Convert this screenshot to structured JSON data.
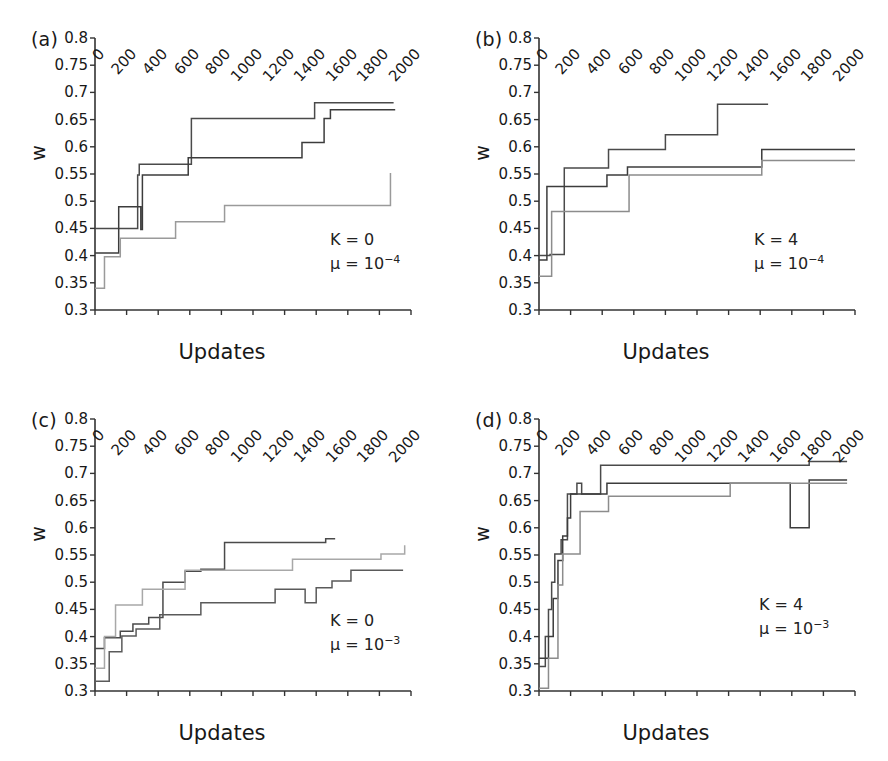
{
  "figure": {
    "panel_count": 4,
    "axis": {
      "ylabel": "w",
      "xlabel": "Updates",
      "yticks": [
        "0.3",
        "0.35",
        "0.4",
        "0.45",
        "0.5",
        "0.55",
        "0.6",
        "0.65",
        "0.7",
        "0.75",
        "0.8"
      ],
      "ytick_values": [
        0.3,
        0.35,
        0.4,
        0.45,
        0.5,
        0.55,
        0.6,
        0.65,
        0.7,
        0.75,
        0.8
      ],
      "xticks": [
        "0",
        "200",
        "400",
        "600",
        "800",
        "1000",
        "1200",
        "1400",
        "1600",
        "1800",
        "2000"
      ],
      "xtick_values": [
        0,
        200,
        400,
        600,
        800,
        1000,
        1200,
        1400,
        1600,
        1800,
        2000
      ],
      "ylim": [
        0.3,
        0.8
      ],
      "xlim": [
        0,
        2000
      ]
    },
    "colors": {
      "line_dark": "#3a3a3a",
      "line_mid": "#5a5a5a",
      "line_light": "#8e8e8e",
      "axis": "#333333",
      "text": "#181818"
    },
    "panels": [
      {
        "id": "a",
        "label": "(a)",
        "annotation_k": "K = 0",
        "annotation_mu_base": "μ = 10",
        "annotation_mu_exp": "−4"
      },
      {
        "id": "b",
        "label": "(b)",
        "annotation_k": "K = 4",
        "annotation_mu_base": "μ = 10",
        "annotation_mu_exp": "−4"
      },
      {
        "id": "c",
        "label": "(c)",
        "annotation_k": "K = 0",
        "annotation_mu_base": "μ = 10",
        "annotation_mu_exp": "−3"
      },
      {
        "id": "d",
        "label": "(d)",
        "annotation_k": "K = 4",
        "annotation_mu_base": "μ = 10",
        "annotation_mu_exp": "−3"
      }
    ]
  },
  "chart_data": [
    {
      "type": "line",
      "panel": "a",
      "title": "(a) K = 0, mu = 10^-4",
      "xlabel": "Updates",
      "ylabel": "w",
      "xlim": [
        0,
        2000
      ],
      "ylim": [
        0.3,
        0.8
      ],
      "grid": false,
      "legend": "none",
      "step": "post",
      "annotations": [
        "K = 0",
        "μ = 10−4"
      ],
      "series": [
        {
          "name": "replicate-1",
          "color": "#4a4a4a",
          "x": [
            0,
            30,
            150,
            160,
            270,
            280,
            600,
            610,
            1380,
            1390,
            1890
          ],
          "values": [
            0.45,
            0.45,
            0.45,
            0.45,
            0.548,
            0.568,
            0.568,
            0.652,
            0.652,
            0.681,
            0.681
          ]
        },
        {
          "name": "replicate-2",
          "color": "#3c3c3c",
          "x": [
            0,
            20,
            140,
            150,
            180,
            190,
            290,
            300,
            580,
            590,
            1300,
            1310,
            1440,
            1450,
            1480,
            1490,
            1900
          ],
          "values": [
            0.405,
            0.405,
            0.405,
            0.49,
            0.49,
            0.49,
            0.448,
            0.548,
            0.548,
            0.58,
            0.58,
            0.608,
            0.608,
            0.652,
            0.652,
            0.668,
            0.668
          ]
        },
        {
          "name": "replicate-3",
          "color": "#9a9a9a",
          "x": [
            0,
            10,
            60,
            150,
            160,
            500,
            510,
            810,
            820,
            1860,
            1870
          ],
          "values": [
            0.34,
            0.34,
            0.398,
            0.398,
            0.432,
            0.432,
            0.462,
            0.462,
            0.492,
            0.492,
            0.552
          ]
        }
      ]
    },
    {
      "type": "line",
      "panel": "b",
      "title": "(b) K = 4, mu = 10^-4",
      "xlabel": "Updates",
      "ylabel": "w",
      "xlim": [
        0,
        2000
      ],
      "ylim": [
        0.3,
        0.8
      ],
      "grid": false,
      "legend": "none",
      "step": "post",
      "annotations": [
        "K = 4",
        "μ = 10−4"
      ],
      "series": [
        {
          "name": "replicate-1",
          "color": "#4a4a4a",
          "x": [
            0,
            20,
            60,
            70,
            150,
            160,
            430,
            440,
            790,
            800,
            1120,
            1130,
            1450
          ],
          "values": [
            0.4,
            0.4,
            0.4,
            0.402,
            0.402,
            0.561,
            0.561,
            0.595,
            0.595,
            0.622,
            0.622,
            0.678,
            0.678
          ]
        },
        {
          "name": "replicate-2",
          "color": "#3c3c3c",
          "x": [
            0,
            20,
            40,
            50,
            420,
            430,
            550,
            560,
            1400,
            1410,
            2000
          ],
          "values": [
            0.392,
            0.392,
            0.392,
            0.527,
            0.527,
            0.548,
            0.548,
            0.563,
            0.563,
            0.595,
            0.595
          ]
        },
        {
          "name": "replicate-3",
          "color": "#8c8c8c",
          "x": [
            0,
            30,
            70,
            80,
            560,
            570,
            1400,
            1410,
            2000
          ],
          "values": [
            0.362,
            0.362,
            0.362,
            0.481,
            0.481,
            0.548,
            0.548,
            0.575,
            0.575
          ]
        }
      ]
    },
    {
      "type": "line",
      "panel": "c",
      "title": "(c) K = 0, mu = 10^-3",
      "xlabel": "Updates",
      "ylabel": "w",
      "xlim": [
        0,
        2000
      ],
      "ylim": [
        0.3,
        0.8
      ],
      "grid": false,
      "legend": "none",
      "step": "post",
      "annotations": [
        "K = 0",
        "μ = 10−3"
      ],
      "series": [
        {
          "name": "replicate-1",
          "color": "#4a4a4a",
          "x": [
            0,
            30,
            60,
            150,
            160,
            230,
            240,
            330,
            340,
            420,
            430,
            560,
            570,
            660,
            670,
            810,
            820,
            1450,
            1460,
            1520
          ],
          "values": [
            0.378,
            0.378,
            0.398,
            0.398,
            0.41,
            0.41,
            0.423,
            0.423,
            0.435,
            0.435,
            0.5,
            0.5,
            0.52,
            0.52,
            0.524,
            0.524,
            0.573,
            0.573,
            0.58,
            0.58
          ]
        },
        {
          "name": "replicate-2",
          "color": "#a8a8a8",
          "x": [
            0,
            20,
            60,
            120,
            130,
            290,
            300,
            560,
            570,
            1240,
            1250,
            1800,
            1810,
            1950,
            1960
          ],
          "values": [
            0.342,
            0.342,
            0.4,
            0.4,
            0.458,
            0.458,
            0.487,
            0.487,
            0.522,
            0.522,
            0.542,
            0.542,
            0.552,
            0.552,
            0.568
          ]
        },
        {
          "name": "replicate-3",
          "color": "#5a5a5a",
          "x": [
            0,
            80,
            90,
            160,
            170,
            250,
            260,
            400,
            410,
            660,
            670,
            1130,
            1140,
            1320,
            1330,
            1390,
            1400,
            1490,
            1500,
            1610,
            1620,
            1950
          ],
          "values": [
            0.318,
            0.318,
            0.372,
            0.372,
            0.401,
            0.401,
            0.414,
            0.414,
            0.44,
            0.44,
            0.462,
            0.462,
            0.487,
            0.487,
            0.462,
            0.462,
            0.49,
            0.49,
            0.502,
            0.502,
            0.522,
            0.522
          ]
        }
      ]
    },
    {
      "type": "line",
      "panel": "d",
      "title": "(d) K = 4, mu = 10^-3",
      "xlabel": "Updates",
      "ylabel": "w",
      "xlim": [
        0,
        2000
      ],
      "ylim": [
        0.3,
        0.8
      ],
      "grid": false,
      "legend": "none",
      "step": "post",
      "annotations": [
        "K = 4",
        "μ = 10−3"
      ],
      "series": [
        {
          "name": "replicate-1",
          "color": "#4a4a4a",
          "x": [
            0,
            20,
            40,
            60,
            80,
            100,
            120,
            140,
            160,
            180,
            230,
            240,
            260,
            270,
            380,
            390,
            1700,
            1710,
            1950
          ],
          "values": [
            0.345,
            0.345,
            0.4,
            0.45,
            0.5,
            0.552,
            0.552,
            0.578,
            0.578,
            0.662,
            0.662,
            0.682,
            0.682,
            0.662,
            0.662,
            0.715,
            0.715,
            0.722,
            0.722
          ]
        },
        {
          "name": "replicate-2",
          "color": "#3c3c3c",
          "x": [
            0,
            30,
            60,
            90,
            120,
            150,
            180,
            200,
            420,
            430,
            1580,
            1590,
            1700,
            1710,
            1950
          ],
          "values": [
            0.36,
            0.36,
            0.4,
            0.47,
            0.54,
            0.585,
            0.618,
            0.662,
            0.662,
            0.682,
            0.682,
            0.6,
            0.6,
            0.688,
            0.688
          ]
        },
        {
          "name": "replicate-3",
          "color": "#8c8c8c",
          "x": [
            0,
            40,
            60,
            90,
            120,
            150,
            170,
            260,
            270,
            430,
            440,
            1200,
            1210,
            1620,
            1630,
            1950
          ],
          "values": [
            0.305,
            0.305,
            0.36,
            0.36,
            0.495,
            0.552,
            0.552,
            0.63,
            0.63,
            0.63,
            0.658,
            0.658,
            0.682,
            0.682,
            0.682,
            0.682
          ]
        }
      ]
    }
  ]
}
